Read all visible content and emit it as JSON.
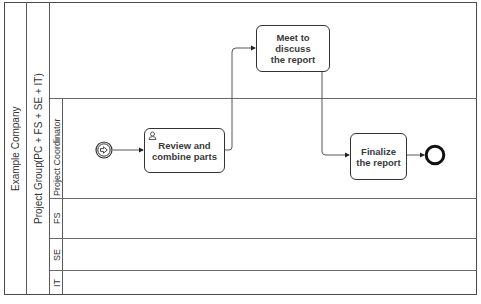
{
  "pool": {
    "label": "Example Company"
  },
  "subpool": {
    "label_line1": "Project Group",
    "label_line2": "(PC + FS + SE + IT)"
  },
  "lanes": [
    {
      "id": "pc",
      "label": "Project Coordinator"
    },
    {
      "id": "fs",
      "label": "FS"
    },
    {
      "id": "se",
      "label": "SE"
    },
    {
      "id": "it",
      "label": "IT"
    }
  ],
  "events": {
    "start": {
      "type": "start-message-signal",
      "icon": "arrow-right-icon"
    },
    "end": {
      "type": "end"
    }
  },
  "tasks": [
    {
      "id": "review",
      "label_line1": "Review and",
      "label_line2": "combine parts",
      "marker": "user-icon",
      "lane": "Project Coordinator"
    },
    {
      "id": "meet",
      "label_line1": "Meet to",
      "label_line2": "discuss",
      "label_line3": "the report",
      "lane": "Project Group"
    },
    {
      "id": "finalize",
      "label_line1": "Finalize",
      "label_line2": "the report",
      "lane": "Project Coordinator"
    }
  ],
  "flows": [
    {
      "from": "start",
      "to": "review"
    },
    {
      "from": "review",
      "to": "meet"
    },
    {
      "from": "meet",
      "to": "finalize"
    },
    {
      "from": "finalize",
      "to": "end"
    }
  ]
}
